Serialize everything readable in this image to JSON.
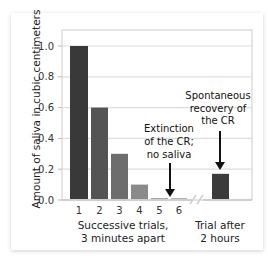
{
  "chart_data": {
    "type": "bar",
    "title": "",
    "ylabel": "Amount of saliva in cubic centimeters",
    "xlabel_left": [
      "Successive trials,",
      "3 minutes apart"
    ],
    "xlabel_right": [
      "Trial after",
      "2 hours"
    ],
    "ylim": [
      0.0,
      1.0
    ],
    "yticks": [
      "0.0",
      "0.2",
      "0.4",
      "0.6",
      "0.8",
      "1.0"
    ],
    "grid": true,
    "categories": [
      "1",
      "2",
      "3",
      "4",
      "5",
      "6",
      "Trial after 2 hours"
    ],
    "values": [
      1.0,
      0.6,
      0.3,
      0.1,
      0.01,
      0.01,
      0.17
    ],
    "bar_colors": [
      "#393939",
      "#545454",
      "#6d6d6d",
      "#8a8a8a",
      "#a8a8a8",
      "#b0b0b0",
      "#3b3b3b"
    ],
    "axis_break": "between trial 6 and trial after 2 hours",
    "annotations": [
      {
        "target": "5",
        "lines": [
          "Extinction",
          "of the CR;",
          "no saliva"
        ]
      },
      {
        "target": "Trial after 2 hours",
        "lines": [
          "Spontaneous",
          "recovery of",
          "the CR"
        ]
      }
    ]
  }
}
